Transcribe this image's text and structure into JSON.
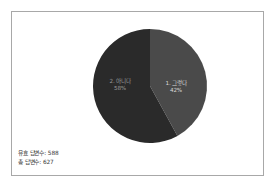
{
  "chart_data": {
    "type": "pie",
    "title": "",
    "categories": [
      "1. 그렇다",
      "2. 아니다"
    ],
    "values": [
      42,
      58
    ],
    "labels": [
      "42%",
      "58%"
    ],
    "colors": [
      "#4a4a4a",
      "#2a2a2a"
    ],
    "start_angle_deg": 0,
    "direction": "clockwise",
    "legend": "none",
    "grid": false,
    "slices": [
      {
        "name": "1. 그렇다",
        "percent": 42,
        "percent_label": "42%",
        "color": "#4a4a4a"
      },
      {
        "name": "2. 아니다",
        "percent": 58,
        "percent_label": "58%",
        "color": "#2a2a2a"
      }
    ]
  },
  "footer": {
    "valid_responses": "유효 답변수: 588",
    "total_responses": "총 답변수: 627"
  },
  "style": {
    "border_color": "#a8a8a8",
    "background": "#ffffff",
    "slice_light": "#4a4a4a",
    "slice_dark": "#2a2a2a"
  }
}
